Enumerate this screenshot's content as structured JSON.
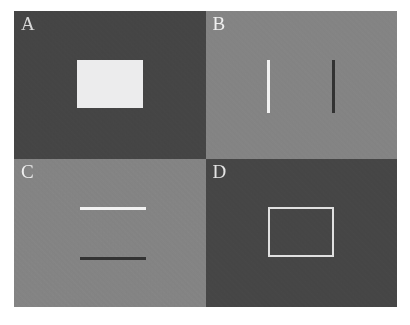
{
  "figure": {
    "name": "four-panel-visual-stimulus-figure",
    "background_color": "#ffffff",
    "panel_divider_color": "#777777"
  },
  "panels": [
    {
      "id": "A",
      "label": "A",
      "position": "top-left",
      "background_color": "#454545",
      "background_tone": "dark gray",
      "stimulus": {
        "kind": "filled-rectangle",
        "color": "#ececed",
        "tone": "light",
        "contrast": "light-on-dark"
      }
    },
    {
      "id": "B",
      "label": "B",
      "position": "top-right",
      "background_color": "#848484",
      "background_tone": "mid gray",
      "stimulus": {
        "kind": "vertical-line-pair",
        "left_line_color": "#f2f2f2",
        "left_line_tone": "light",
        "right_line_color": "#323232",
        "right_line_tone": "dark"
      }
    },
    {
      "id": "C",
      "label": "C",
      "position": "bottom-left",
      "background_color": "#848484",
      "background_tone": "mid gray",
      "stimulus": {
        "kind": "horizontal-line-pair",
        "top_line_color": "#f2f2f2",
        "top_line_tone": "light",
        "bottom_line_color": "#333333",
        "bottom_line_tone": "dark"
      }
    },
    {
      "id": "D",
      "label": "D",
      "position": "bottom-right",
      "background_color": "#464646",
      "background_tone": "dark gray",
      "stimulus": {
        "kind": "outlined-rectangle",
        "color": "#e0e0e0",
        "tone": "light",
        "contrast": "light-outline-on-dark"
      }
    }
  ]
}
